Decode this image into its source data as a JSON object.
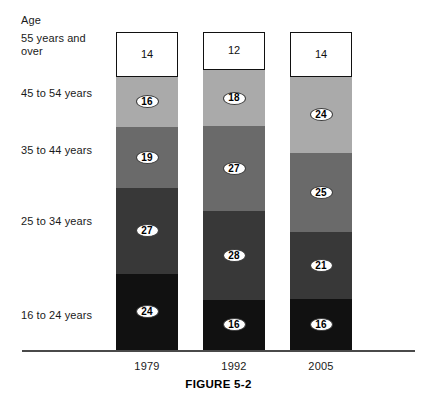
{
  "header": {
    "age_label": "Age"
  },
  "row_labels": [
    {
      "text": "55 years and\nover",
      "top": 32
    },
    {
      "text": "45 to 54 years",
      "top": 87
    },
    {
      "text": "35 to 44 years",
      "top": 144
    },
    {
      "text": "25 to 34 years",
      "top": 215
    },
    {
      "text": "16 to 24 years",
      "top": 309
    }
  ],
  "years": [
    {
      "label": "1979",
      "left": 116
    },
    {
      "label": "1992",
      "left": 203
    },
    {
      "label": "2005",
      "left": 290
    }
  ],
  "caption": "FIGURE 5-2",
  "colors": {
    "segment_16_24": "#111111",
    "segment_25_34": "#383838",
    "segment_35_44": "#6a6a6a",
    "segment_45_54": "#aaaaaa",
    "segment_55_over": "#ffffff",
    "outline": "#111111",
    "baseline": "#4a4a4a",
    "text": "#1a1a1a"
  },
  "chart_data": {
    "type": "bar",
    "title": "FIGURE 5-2",
    "xlabel": "",
    "ylabel": "Age",
    "stacked": true,
    "percent": true,
    "grid": false,
    "legend": "left-axis-labels",
    "ylim": [
      0,
      100
    ],
    "categories": [
      "1979",
      "1992",
      "2005"
    ],
    "series": [
      {
        "name": "16 to 24 years",
        "values": [
          24,
          16,
          16
        ],
        "color": "#111111"
      },
      {
        "name": "25 to 34 years",
        "values": [
          27,
          28,
          21
        ],
        "color": "#383838"
      },
      {
        "name": "35 to 44 years",
        "values": [
          19,
          27,
          25
        ],
        "color": "#6a6a6a"
      },
      {
        "name": "45 to 54 years",
        "values": [
          16,
          18,
          24
        ],
        "color": "#aaaaaa"
      },
      {
        "name": "55 years and over",
        "values": [
          14,
          12,
          14
        ],
        "color": "#ffffff"
      }
    ]
  },
  "layout": {
    "bar_width": 62,
    "bar_left": [
      116,
      203,
      290
    ],
    "plot_bottom": 350,
    "plot_height": 318,
    "baseline_top": 350,
    "year_label_top": 360,
    "caption_top": 378
  }
}
